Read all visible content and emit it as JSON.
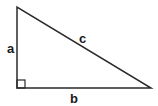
{
  "diagram": {
    "type": "right-triangle",
    "labels": {
      "a": "a",
      "b": "b",
      "c": "c"
    },
    "vertices": {
      "top": [
        17,
        7
      ],
      "right_angle": [
        17,
        88
      ],
      "right": [
        151,
        88
      ]
    },
    "stroke_color": "#2a2a2a"
  }
}
